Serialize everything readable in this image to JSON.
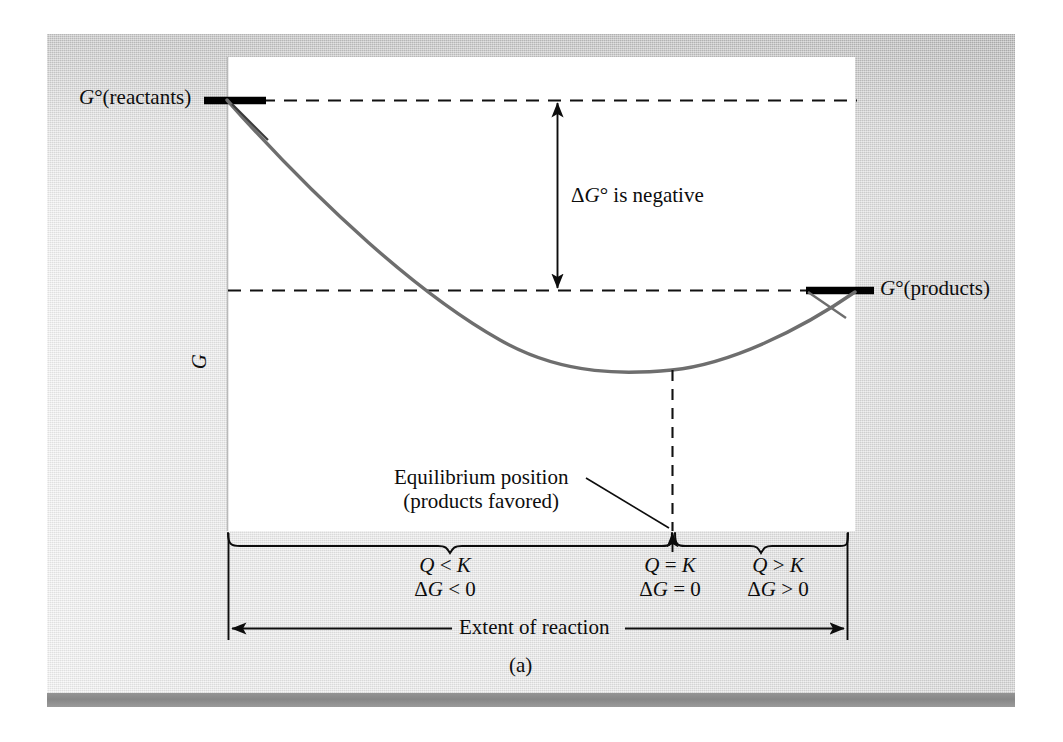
{
  "figure": {
    "caption": "(a)",
    "axis_y_label": "G",
    "axis_x_label": "Extent of reaction",
    "reactants_label": "G°(reactants)",
    "products_label": "G°(products)",
    "delta_g_label": "ΔG° is negative",
    "equilibrium_label_line1": "Equilibrium position",
    "equilibrium_label_line2": "(products favored)",
    "region_left_line1": "Q < K",
    "region_left_line2": "ΔG < 0",
    "region_mid_line1": "Q = K",
    "region_mid_line2": "ΔG = 0",
    "region_right_line1": "Q > K",
    "region_right_line2": "ΔG > 0",
    "colors": {
      "panel_background": "#e9e9e9",
      "plot_background": "#ffffff",
      "curve": "#6e6e6e",
      "ink": "#0d0d0d",
      "bottom_band": "#8f8f8f"
    }
  },
  "chart_data": {
    "type": "line",
    "xlabel": "Extent of reaction",
    "ylabel": "G",
    "grid": false,
    "legend": false,
    "axis_ranges": {
      "x": [
        0,
        1
      ],
      "y": [
        0,
        1
      ]
    },
    "series": [
      {
        "name": "Free energy G",
        "description": "Parabolic free-energy curve descending from G°(reactants) to a minimum at the equilibrium position, then rising to G°(products)",
        "x": [
          0.0,
          0.1,
          0.2,
          0.3,
          0.4,
          0.5,
          0.6,
          0.71,
          0.8,
          0.9,
          1.0
        ],
        "y": [
          1.0,
          0.905,
          0.805,
          0.7,
          0.597,
          0.5,
          0.415,
          0.35,
          0.368,
          0.452,
          0.595
        ]
      }
    ],
    "reference_levels": [
      {
        "name": "G°(reactants)",
        "y": 1.0,
        "style": "dashed-horizontal"
      },
      {
        "name": "G°(products)",
        "y": 0.595,
        "style": "dashed-horizontal"
      }
    ],
    "annotations": [
      {
        "name": "delta-g-standard",
        "text": "ΔG° is negative",
        "type": "double-arrow",
        "x": 0.525,
        "y_from": 1.0,
        "y_to": 0.595
      },
      {
        "name": "equilibrium-position",
        "text": "Equilibrium position (products favored)",
        "type": "leader-arrow",
        "x": 0.71,
        "y": 0.0
      },
      {
        "name": "region-reactants-side",
        "text": "Q < K, ΔG < 0",
        "type": "brace",
        "x_from": 0.0,
        "x_to": 0.71
      },
      {
        "name": "region-equilibrium",
        "text": "Q = K, ΔG = 0",
        "type": "point",
        "x": 0.71
      },
      {
        "name": "region-products-side",
        "text": "Q > K, ΔG > 0",
        "type": "brace",
        "x_from": 0.71,
        "x_to": 1.0
      }
    ]
  }
}
